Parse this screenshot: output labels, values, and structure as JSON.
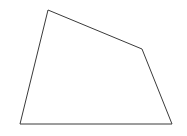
{
  "canvas": {
    "width": 187,
    "height": 136,
    "background_color": "#ffffff"
  },
  "figure": {
    "name": "irregular-polygon",
    "stroke_color": "#3a3a3a",
    "fill_color": "#ffffff",
    "stroke_width": 1
  },
  "chart_data": {
    "type": "scatter",
    "title": "",
    "subtitle": "",
    "xlabel": "",
    "ylabel": "",
    "grid": false,
    "legend": null,
    "xlim": [
      0,
      187
    ],
    "ylim": [
      0,
      136
    ],
    "shapes": [
      {
        "name": "irregular-polygon",
        "kind": "polygon",
        "closed": true,
        "vertex_count": 5,
        "vertices": [
          [
            48,
            10
          ],
          [
            142,
            49
          ],
          [
            172,
            124
          ],
          [
            20,
            124
          ]
        ],
        "points_string": "48,10 142,49 172,124 20,124",
        "stroke": "#3a3a3a",
        "fill": "#ffffff",
        "stroke_width": 1
      }
    ],
    "annotations": [],
    "labels": []
  }
}
